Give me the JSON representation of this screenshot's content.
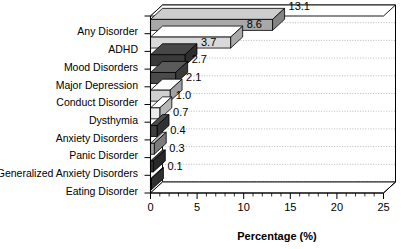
{
  "chart_data": {
    "type": "bar",
    "orientation": "horizontal",
    "style": "3d",
    "title": "",
    "xlabel": "Percentage (%)",
    "ylabel": "",
    "xlim": [
      0,
      25
    ],
    "xticks": [
      0,
      5,
      10,
      15,
      20,
      25
    ],
    "xtick_labels": [
      "0",
      "5",
      "10",
      "15",
      "20",
      "25"
    ],
    "minor_tick_interval": 1,
    "grid": "horizontal-dotted",
    "legend": "none",
    "categories": [
      "Any Disorder",
      "ADHD",
      "Mood Disorders",
      "Major Depression",
      "Conduct Disorder",
      "Dysthymia",
      "Anxiety Disorders",
      "Panic Disorder",
      "Generalized Anxiety Disorders",
      "Eating Disorder"
    ],
    "values": [
      13.1,
      8.6,
      3.7,
      2.7,
      2.1,
      1.0,
      0.7,
      0.4,
      0.3,
      0.1
    ],
    "value_labels": [
      "13.1",
      "8.6",
      "3.7",
      "2.7",
      "2.1",
      "1.0",
      "0.7",
      "0.4",
      "0.3",
      "0.1"
    ],
    "bar_colors": [
      "#a8a8a8",
      "#d9d9d9",
      "#3a3a3a",
      "#4a4a4a",
      "#d0d0d0",
      "#ebebeb",
      "#3f3f3f",
      "#9e9e9e",
      "#343434",
      "#3c3c3c"
    ]
  },
  "axis": {
    "x_title": "Percentage (%)"
  }
}
